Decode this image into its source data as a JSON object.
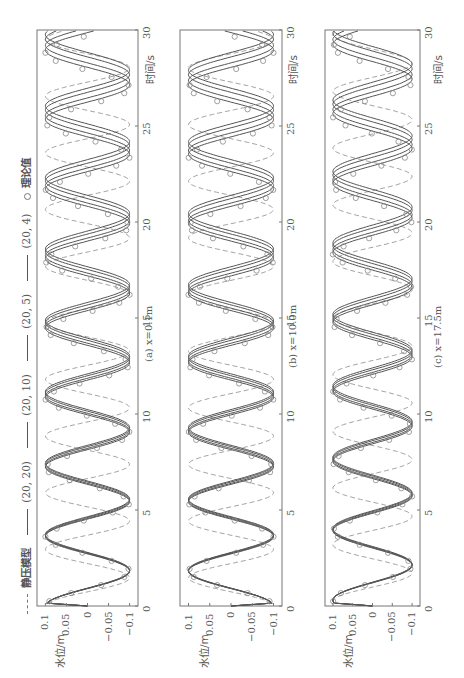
{
  "legend": {
    "static_model": "静压模型",
    "series_20_20": "(20, 20)",
    "series_20_10": "(20, 10)",
    "series_20_5": "(20, 5)",
    "series_20_4": "(20, 4)",
    "theory": "理论值"
  },
  "axes": {
    "xlabel": "时间/s",
    "ylabel": "水位/m",
    "x_ticks": [
      "0",
      "5",
      "10",
      "15",
      "20",
      "25",
      "30"
    ],
    "y_ticks": [
      "0.1",
      "0.05",
      "0",
      "-0.05",
      "-0.1"
    ]
  },
  "panels": [
    {
      "caption": "(a) x=0.1m"
    },
    {
      "caption": "(b) x=10.0m"
    },
    {
      "caption": "(c) x=17.5m"
    }
  ],
  "chart_data": [
    {
      "type": "line",
      "title": "(a) x=0.1m",
      "xlabel": "时间/s",
      "ylabel": "水位/m",
      "xlim": [
        0,
        30
      ],
      "ylim": [
        -0.12,
        0.12
      ],
      "x_ticks": [
        0,
        5,
        10,
        15,
        20,
        25,
        30
      ],
      "y_ticks": [
        0.1,
        0.05,
        0,
        -0.05,
        -0.1
      ],
      "orientation": "rotated 90° counter-clockwise (time runs bottom-to-top)",
      "series": [
        {
          "name": "静压模型",
          "style": "dashed",
          "amplitude": 0.1,
          "period": 2.95,
          "phase_deg": 90
        },
        {
          "name": "(20, 20)",
          "style": "solid",
          "amplitude": 0.1,
          "period": 3.62,
          "phase_deg": 90
        },
        {
          "name": "(20, 10)",
          "style": "solid",
          "amplitude": 0.1,
          "period": 3.65,
          "phase_deg": 90
        },
        {
          "name": "(20, 5)",
          "style": "solid",
          "amplitude": 0.1,
          "period": 3.69,
          "phase_deg": 90
        },
        {
          "name": "(20, 4)",
          "style": "solid",
          "amplitude": 0.1,
          "period": 3.72,
          "phase_deg": 90
        },
        {
          "name": "理论值",
          "style": "circle-markers",
          "amplitude": 0.1,
          "period": 3.6,
          "phase_deg": 90
        }
      ]
    },
    {
      "type": "line",
      "title": "(b) x=10.0m",
      "xlabel": "时间/s",
      "ylabel": "水位/m",
      "xlim": [
        0,
        30
      ],
      "ylim": [
        -0.12,
        0.12
      ],
      "x_ticks": [
        0,
        5,
        10,
        15,
        20,
        25,
        30
      ],
      "y_ticks": [
        0.1,
        0.05,
        0,
        -0.05,
        -0.1
      ],
      "series": [
        {
          "name": "静压模型",
          "style": "dashed",
          "amplitude": 0.1,
          "period": 2.95,
          "phase_deg": -90
        },
        {
          "name": "(20, 20)",
          "style": "solid",
          "amplitude": 0.1,
          "period": 3.62,
          "phase_deg": -90
        },
        {
          "name": "(20, 10)",
          "style": "solid",
          "amplitude": 0.1,
          "period": 3.65,
          "phase_deg": -90
        },
        {
          "name": "(20, 5)",
          "style": "solid",
          "amplitude": 0.1,
          "period": 3.69,
          "phase_deg": -90
        },
        {
          "name": "(20, 4)",
          "style": "solid",
          "amplitude": 0.1,
          "period": 3.72,
          "phase_deg": -90
        },
        {
          "name": "理论值",
          "style": "circle-markers",
          "amplitude": 0.1,
          "period": 3.6,
          "phase_deg": -90
        }
      ]
    },
    {
      "type": "line",
      "title": "(c) x=17.5m",
      "xlabel": "时间/s",
      "ylabel": "水位/m",
      "xlim": [
        0,
        30
      ],
      "ylim": [
        -0.12,
        0.12
      ],
      "x_ticks": [
        0,
        5,
        10,
        15,
        20,
        25,
        30
      ],
      "y_ticks": [
        0.1,
        0.05,
        0,
        -0.05,
        -0.1
      ],
      "series": [
        {
          "name": "静压模型",
          "style": "dashed",
          "amplitude": 0.1,
          "period": 2.95,
          "phase_deg": 60
        },
        {
          "name": "(20, 20)",
          "style": "solid",
          "amplitude": 0.1,
          "period": 3.62,
          "phase_deg": 60
        },
        {
          "name": "(20, 10)",
          "style": "solid",
          "amplitude": 0.1,
          "period": 3.65,
          "phase_deg": 60
        },
        {
          "name": "(20, 5)",
          "style": "solid",
          "amplitude": 0.1,
          "period": 3.69,
          "phase_deg": 60
        },
        {
          "name": "(20, 4)",
          "style": "solid",
          "amplitude": 0.1,
          "period": 3.72,
          "phase_deg": 60
        },
        {
          "name": "理论值",
          "style": "circle-markers",
          "amplitude": 0.1,
          "period": 3.6,
          "phase_deg": 60
        }
      ]
    }
  ],
  "colors": {
    "frame": "#777777",
    "solid_lines": "#555555",
    "dashed_line": "#999999",
    "markers": "#888888",
    "text": "#555555"
  }
}
